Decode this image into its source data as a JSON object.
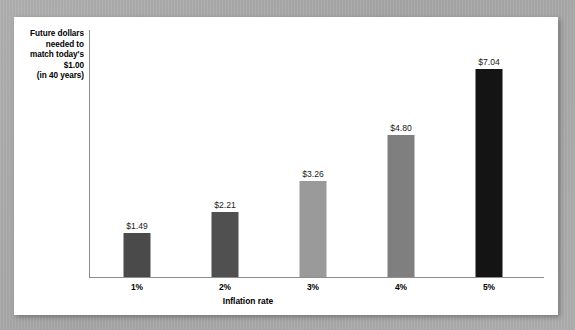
{
  "chart_data": {
    "type": "bar",
    "title": "",
    "subtitle": "",
    "xlabel": "Inflation rate",
    "ylabel": "Future dollars needed to match today's $1.00 (in 40 years)",
    "ylabel_lines": [
      "Future dollars",
      "needed to",
      "match today's",
      "$1.00",
      "(in 40 years)"
    ],
    "categories": [
      "1%",
      "2%",
      "3%",
      "4%",
      "5%"
    ],
    "values": [
      1.49,
      2.21,
      3.26,
      4.8,
      7.04
    ],
    "data_labels": [
      "$1.49",
      "$2.21",
      "$3.26",
      "$4.80",
      "$7.04"
    ],
    "bar_colors": [
      "#4a4a4a",
      "#505050",
      "#9a9a9a",
      "#7f7f7f",
      "#141414"
    ],
    "ylim": [
      0,
      8.35
    ],
    "grid": false,
    "legend": null,
    "axis_color": "#8d8d8d"
  },
  "page": {
    "background_color": "#a9a9a9",
    "card_color": "#ffffff"
  }
}
